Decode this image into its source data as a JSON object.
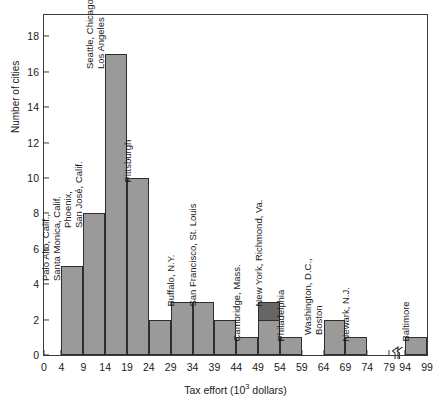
{
  "figure": {
    "top_artifact": "",
    "background": "#ffffff",
    "frame_color": "#3a3a3a"
  },
  "chart_data": {
    "type": "bar",
    "title": "",
    "subtitle": "",
    "xlabel": "Tax effort (10^3 dollars)",
    "xlabel_prefix": "Tax effort (10",
    "xlabel_exponent": "3",
    "xlabel_suffix": " dollars)",
    "ylabel": "Number of cities",
    "xlim": [
      0,
      99
    ],
    "ylim": [
      0,
      19.2
    ],
    "grid": false,
    "legend": "none",
    "bar_fill": "#9a9a9a",
    "bar_edge": "#2e2e2e",
    "bar_fill_highlight": "#666666",
    "x_ticks": [
      0,
      4,
      9,
      14,
      19,
      24,
      29,
      34,
      39,
      44,
      49,
      54,
      59,
      64,
      69,
      74,
      79,
      94,
      99
    ],
    "x_tick_labels": [
      "0",
      "4",
      "9",
      "14",
      "19",
      "24",
      "29",
      "34",
      "39",
      "44",
      "49",
      "54",
      "59",
      "64",
      "69",
      "74",
      "79",
      "94",
      "99"
    ],
    "y_ticks": [
      0,
      2,
      4,
      6,
      8,
      10,
      12,
      14,
      16,
      18
    ],
    "y_tick_labels": [
      "0",
      "2",
      "4",
      "6",
      "8",
      "10",
      "12",
      "14",
      "16",
      "18"
    ],
    "axis_break": {
      "present": true,
      "between": [
        79,
        94
      ],
      "style": "zigzag"
    },
    "bin_width": 5,
    "bins": [
      {
        "start": 4,
        "end": 9,
        "value": 5,
        "annotation": [
          "Palo Alto, Calif.,",
          "Santa Monica, Calif."
        ],
        "highlight": 0
      },
      {
        "start": 9,
        "end": 14,
        "value": 8,
        "annotation": [
          "Phoenix,",
          "San José, Calif."
        ],
        "highlight": 0
      },
      {
        "start": 14,
        "end": 19,
        "value": 17,
        "annotation": [
          "Seattle, Chicago,",
          "Los Angeles"
        ],
        "highlight": 0
      },
      {
        "start": 19,
        "end": 24,
        "value": 10,
        "annotation": [
          "Pittsburgh"
        ],
        "highlight": 0
      },
      {
        "start": 24,
        "end": 29,
        "value": 2,
        "annotation": [],
        "highlight": 0
      },
      {
        "start": 29,
        "end": 34,
        "value": 3,
        "annotation": [
          "Buffalo, N.Y."
        ],
        "highlight": 0
      },
      {
        "start": 34,
        "end": 39,
        "value": 3,
        "annotation": [
          "San Francisco, St. Louis"
        ],
        "highlight": 0
      },
      {
        "start": 39,
        "end": 44,
        "value": 2,
        "annotation": [],
        "highlight": 0
      },
      {
        "start": 44,
        "end": 49,
        "value": 1,
        "annotation": [
          "Cambridge, Mass."
        ],
        "highlight": 0
      },
      {
        "start": 49,
        "end": 54,
        "value": 3,
        "annotation": [
          "New York, Richmond, Va."
        ],
        "highlight": 1
      },
      {
        "start": 54,
        "end": 59,
        "value": 1,
        "annotation": [
          "Philadelphia"
        ],
        "highlight": 0
      },
      {
        "start": 59,
        "end": 64,
        "value": 0,
        "annotation": [],
        "highlight": 0
      },
      {
        "start": 64,
        "end": 69,
        "value": 2,
        "annotation": [
          "Washington, D.C.,",
          "Boston"
        ],
        "highlight": 0
      },
      {
        "start": 69,
        "end": 74,
        "value": 1,
        "annotation": [
          "Newark, N.J."
        ],
        "highlight": 0
      },
      {
        "start": 74,
        "end": 79,
        "value": 0,
        "annotation": [],
        "highlight": 0
      },
      {
        "start": 94,
        "end": 99,
        "value": 1,
        "annotation": [
          "Baltimore"
        ],
        "highlight": 0
      }
    ]
  }
}
